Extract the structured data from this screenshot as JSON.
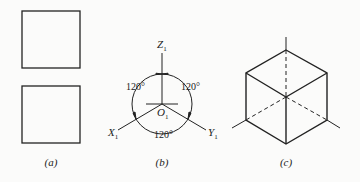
{
  "figure": {
    "panels": [
      {
        "id": "a",
        "caption": "(a)",
        "description": "two orthographic views of a cube (squares)"
      },
      {
        "id": "b",
        "caption": "(b)",
        "description": "isometric axes with 120° between each pair",
        "axes": {
          "z": "Z",
          "x": "X",
          "y": "Y",
          "subscript": "1",
          "origin": "O"
        },
        "angles": [
          "120°",
          "120°",
          "120°"
        ]
      },
      {
        "id": "c",
        "caption": "(c)",
        "description": "isometric drawing of a cube with hidden axis lines dashed"
      }
    ]
  }
}
